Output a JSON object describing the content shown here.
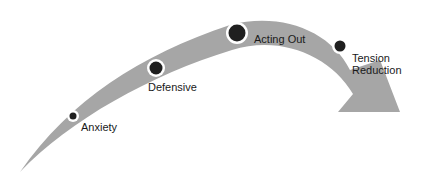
{
  "diagram": {
    "arrow_color": "#a6a6a6",
    "node_color": "#1f1f1f",
    "nodes": [
      {
        "label": "Anxiety"
      },
      {
        "label": "Defensive"
      },
      {
        "label": "Acting Out"
      },
      {
        "label": "Tension Reduction",
        "line1": "Tension",
        "line2": "Reduction"
      }
    ]
  }
}
